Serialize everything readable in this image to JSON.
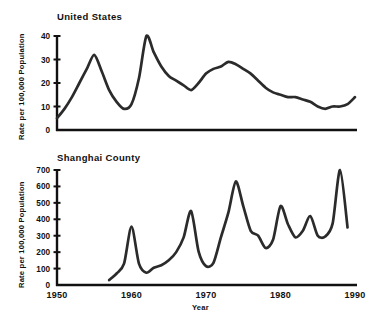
{
  "figure": {
    "xlabel": "Year",
    "ylabel": "Rate per 100,000 Population",
    "xticks": [
      "1950",
      "1960",
      "1970",
      "1980",
      "1990"
    ],
    "line_color": "#2b2b2b",
    "axis_color": "#111111"
  },
  "chart_data": [
    {
      "type": "line",
      "title": "United States",
      "xlabel": "Year",
      "ylabel": "Rate per 100,000 Population",
      "xlim": [
        1950,
        1990
      ],
      "ylim": [
        0,
        40
      ],
      "yticks": [
        0,
        10,
        20,
        30,
        40
      ],
      "xticks": [
        1950,
        1960,
        1970,
        1980,
        1990
      ],
      "grid": false,
      "legend": null,
      "x": [
        1950,
        1951,
        1952,
        1953,
        1954,
        1955,
        1956,
        1957,
        1958,
        1959,
        1960,
        1961,
        1962,
        1963,
        1964,
        1965,
        1966,
        1967,
        1968,
        1969,
        1970,
        1971,
        1972,
        1973,
        1974,
        1975,
        1976,
        1977,
        1978,
        1979,
        1980,
        1981,
        1982,
        1983,
        1984,
        1985,
        1986,
        1987,
        1988,
        1989,
        1990
      ],
      "values": [
        5,
        9,
        14,
        20,
        26,
        32,
        25,
        17,
        12,
        9,
        11,
        22,
        40,
        33,
        27,
        23,
        21,
        19,
        17,
        20,
        24,
        26,
        27,
        29,
        28,
        26,
        24,
        21,
        18,
        16,
        15,
        14,
        14,
        13,
        12,
        10,
        9,
        10,
        10,
        11,
        14
      ]
    },
    {
      "type": "line",
      "title": "Shanghai County",
      "xlabel": "Year",
      "ylabel": "Rate per 100,000 Population",
      "xlim": [
        1950,
        1990
      ],
      "ylim": [
        0,
        700
      ],
      "yticks": [
        0,
        100,
        200,
        300,
        400,
        500,
        600,
        700
      ],
      "xticks": [
        1950,
        1960,
        1970,
        1980,
        1990
      ],
      "grid": false,
      "legend": null,
      "x": [
        1957,
        1958,
        1959,
        1960,
        1961,
        1962,
        1963,
        1964,
        1965,
        1966,
        1967,
        1968,
        1969,
        1970,
        1971,
        1972,
        1973,
        1974,
        1975,
        1976,
        1977,
        1978,
        1979,
        1980,
        1981,
        1982,
        1983,
        1984,
        1985,
        1986,
        1987,
        1988,
        1989
      ],
      "values": [
        30,
        70,
        130,
        355,
        130,
        75,
        105,
        120,
        150,
        200,
        290,
        450,
        205,
        115,
        135,
        290,
        440,
        630,
        480,
        330,
        300,
        225,
        275,
        480,
        370,
        290,
        330,
        420,
        300,
        295,
        375,
        700,
        350
      ]
    }
  ]
}
